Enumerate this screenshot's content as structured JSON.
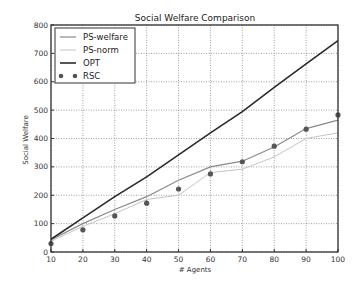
{
  "chart_data": {
    "type": "line",
    "title": "Social Welfare Comparison",
    "xlabel": "# Agents",
    "ylabel": "Social Welfare",
    "xlim": [
      10,
      100
    ],
    "ylim": [
      0,
      800
    ],
    "x": [
      10,
      20,
      30,
      40,
      50,
      60,
      70,
      80,
      90,
      100
    ],
    "xticks": [
      "10",
      "20",
      "30",
      "40",
      "50",
      "60",
      "70",
      "80",
      "90",
      "100"
    ],
    "yticks": [
      "0",
      "100",
      "200",
      "300",
      "400",
      "500",
      "600",
      "700",
      "800"
    ],
    "grid": true,
    "legend_position": "upper left",
    "series": [
      {
        "name": "PS-welfare",
        "style": "line",
        "color": "#8a8a8a",
        "values": [
          43,
          100,
          150,
          195,
          253,
          300,
          320,
          370,
          435,
          465
        ]
      },
      {
        "name": "PS-norm",
        "style": "line",
        "color": "#c4c4c4",
        "values": [
          38,
          90,
          135,
          185,
          200,
          280,
          292,
          335,
          400,
          420
        ]
      },
      {
        "name": "OPT",
        "style": "line",
        "color": "#2a2a2a",
        "values": [
          45,
          120,
          195,
          265,
          342,
          420,
          495,
          580,
          663,
          745
        ]
      },
      {
        "name": "RSC",
        "style": "markers",
        "color": "#555555",
        "values": [
          30,
          78,
          127,
          172,
          222,
          275,
          318,
          373,
          433,
          483
        ]
      }
    ]
  }
}
